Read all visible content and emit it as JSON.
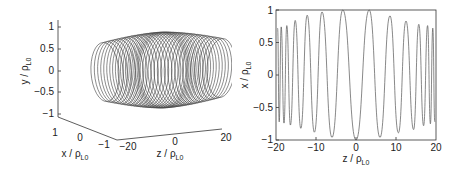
{
  "chart_data": [
    {
      "type": "line3d",
      "title": "",
      "xlabel": "z / ρL0",
      "ylabel": "y / ρL0",
      "zlabel": "x / ρL0",
      "axes": {
        "y": {
          "label": "y / ρ",
          "label_sub": "L0",
          "ticks": [
            "1",
            "0.5",
            "0",
            "−0.5",
            "−1"
          ],
          "range": [
            -1,
            1
          ]
        },
        "x": {
          "label": "x / ρ",
          "label_sub": "L0",
          "ticks": [
            "1",
            "0",
            "−1"
          ],
          "range": [
            -1,
            1
          ]
        },
        "z": {
          "label": "z / ρ",
          "label_sub": "L0",
          "ticks": [
            "−20",
            "0",
            "20"
          ],
          "range": [
            -20,
            20
          ]
        }
      },
      "description": "Helical particle trajectory wound around z-axis; radius ≈1 near z=0 region bulges, tighter-pitched dense loops near z=±20 (magnetic-mirror / bottle shape)",
      "series": [
        {
          "name": "trajectory",
          "color": "#444444"
        }
      ],
      "grid": false
    },
    {
      "type": "line",
      "title": "",
      "xlabel": "z / ρ",
      "xlabel_sub": "L0",
      "ylabel": "x / ρ",
      "ylabel_sub": "L0",
      "xlim": [
        -20,
        20
      ],
      "ylim": [
        -1,
        1
      ],
      "xticks": [
        "−20",
        "−10",
        "0",
        "10",
        "20"
      ],
      "yticks": [
        "1",
        "0.5",
        "0",
        "−0.5",
        "−1"
      ],
      "grid": false,
      "series": [
        {
          "name": "x(z)",
          "color": "#555555",
          "description": "Oscillation with amplitude ≈1 near z=0 decreasing to ≈0.75 near z=±20, with wavelength shrinking toward the edges",
          "peaks": [
            {
              "z": -19.6,
              "x": 0.72
            },
            {
              "z": -18.7,
              "x": 0.74
            },
            {
              "z": -17.3,
              "x": 0.76
            },
            {
              "z": -15.2,
              "x": 0.84
            },
            {
              "z": -12.2,
              "x": 0.92
            },
            {
              "z": -8.5,
              "x": 0.97
            },
            {
              "z": -3.3,
              "x": 1.0
            },
            {
              "z": 3.3,
              "x": 1.0
            },
            {
              "z": 8.5,
              "x": 0.91
            },
            {
              "z": 12.5,
              "x": 0.83
            },
            {
              "z": 15.7,
              "x": 0.78
            },
            {
              "z": 17.9,
              "x": 0.76
            },
            {
              "z": 19.2,
              "x": 0.72
            }
          ],
          "troughs": [
            {
              "z": -19.2,
              "x": -0.72
            },
            {
              "z": -18.0,
              "x": -0.74
            },
            {
              "z": -16.4,
              "x": -0.77
            },
            {
              "z": -13.8,
              "x": -0.82
            },
            {
              "z": -10.4,
              "x": -0.88
            },
            {
              "z": -6.0,
              "x": -0.96
            },
            {
              "z": 0.0,
              "x": -1.0
            },
            {
              "z": 6.0,
              "x": -0.96
            },
            {
              "z": 10.6,
              "x": -0.89
            },
            {
              "z": 14.4,
              "x": -0.84
            },
            {
              "z": 16.9,
              "x": -0.78
            },
            {
              "z": 18.6,
              "x": -0.75
            },
            {
              "z": 19.7,
              "x": -0.72
            }
          ]
        }
      ]
    }
  ]
}
